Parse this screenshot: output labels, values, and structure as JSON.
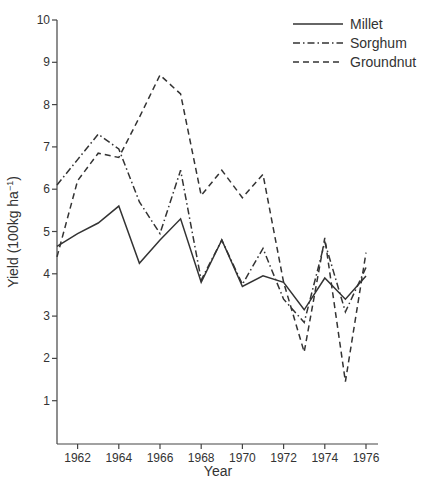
{
  "chart_data": {
    "type": "line",
    "title": "",
    "xlabel": "Year",
    "ylabel": "Yield (100kg ha",
    "ylabel_superscript": "−1",
    "ylabel_suffix": ")",
    "xlim": [
      1961,
      1976.6
    ],
    "ylim": [
      0,
      10
    ],
    "grid": false,
    "legend_position": "upper right",
    "x_ticks": [
      1962,
      1964,
      1966,
      1968,
      1970,
      1972,
      1974,
      1976
    ],
    "y_ticks": [
      1,
      2,
      3,
      4,
      5,
      6,
      7,
      8,
      9,
      10
    ],
    "x": [
      1961,
      1962,
      1963,
      1964,
      1965,
      1966,
      1967,
      1968,
      1969,
      1970,
      1971,
      1972,
      1973,
      1974,
      1975,
      1976
    ],
    "series": [
      {
        "name": "Millet",
        "style": "solid",
        "values": [
          4.65,
          4.95,
          5.2,
          5.6,
          4.25,
          4.8,
          5.3,
          3.8,
          4.8,
          3.7,
          3.95,
          3.8,
          3.15,
          3.9,
          3.4,
          3.95
        ]
      },
      {
        "name": "Sorghum",
        "style": "dashdot",
        "values": [
          6.1,
          6.7,
          7.3,
          6.95,
          5.7,
          4.95,
          6.45,
          3.85,
          4.8,
          3.75,
          4.6,
          3.4,
          2.85,
          4.75,
          3.1,
          4.15
        ]
      },
      {
        "name": "Groundnut",
        "style": "dashed",
        "values": [
          4.4,
          6.2,
          6.85,
          6.75,
          7.7,
          8.7,
          8.25,
          5.85,
          6.45,
          5.8,
          6.35,
          3.8,
          2.15,
          4.85,
          1.45,
          4.5
        ]
      }
    ]
  },
  "legend": {
    "items": [
      {
        "label": "Millet"
      },
      {
        "label": "Sorghum"
      },
      {
        "label": "Groundnut"
      }
    ]
  }
}
